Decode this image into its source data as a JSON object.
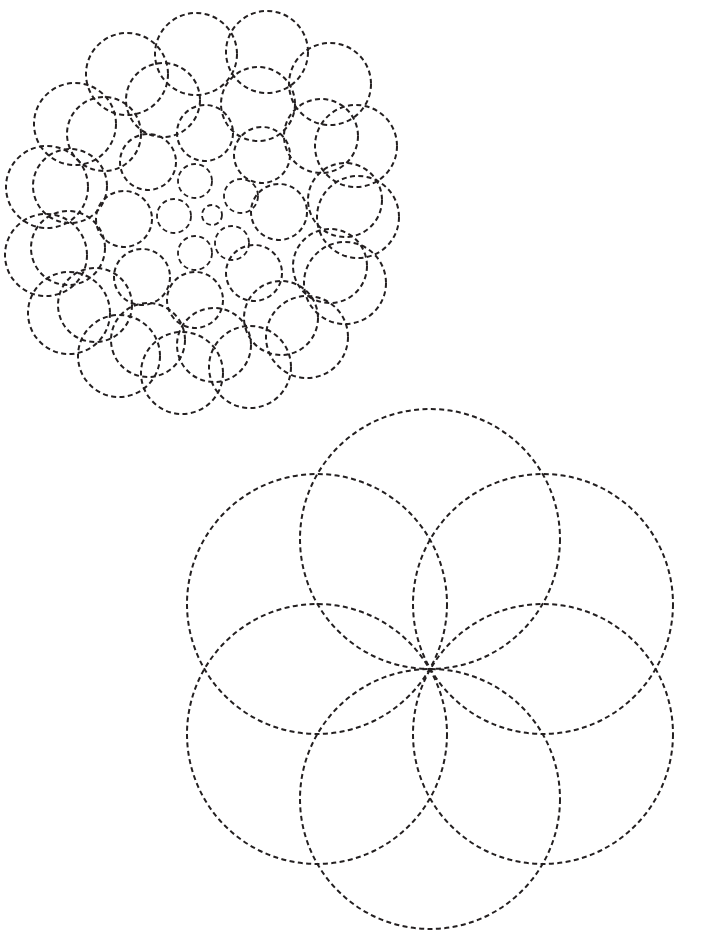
{
  "page": {
    "background_color": "#ffffff",
    "width": 711,
    "height": 943
  },
  "style": {
    "stroke_color": "#231f20",
    "stroke_width": 2.0,
    "stroke_width_thin": 1.8,
    "dash_length": 5,
    "dash_gap": 3.4,
    "dash_array": "5,3.4",
    "fill": "none"
  },
  "figures": [
    {
      "id": "doyle-spiral-figure",
      "name": "Tangent circle spiral rosette",
      "type": "doyle-spiral",
      "bounds": {
        "x": 16,
        "y": 12,
        "width": 374,
        "height": 383
      },
      "center": {
        "x": 212,
        "y": 215
      },
      "description": "Logarithmic spiral packing of mutually tangent dashed circles growing outward from a small central circle",
      "spiral": {
        "arms": 8,
        "rings": 5,
        "growth_ratio": 1.62,
        "twist_degrees": 25,
        "base_radius": 10,
        "base_distance": 0
      },
      "circles": [
        {
          "cx": 212,
          "cy": 215,
          "r": 10
        },
        {
          "cx": 241,
          "cy": 196,
          "r": 17
        },
        {
          "cx": 232,
          "cy": 243,
          "r": 17
        },
        {
          "cx": 195,
          "cy": 253,
          "r": 17
        },
        {
          "cx": 174,
          "cy": 216,
          "r": 17
        },
        {
          "cx": 195,
          "cy": 181,
          "r": 17
        },
        {
          "cx": 262,
          "cy": 155,
          "r": 28
        },
        {
          "cx": 279,
          "cy": 212,
          "r": 28
        },
        {
          "cx": 254,
          "cy": 273,
          "r": 28
        },
        {
          "cx": 195,
          "cy": 300,
          "r": 28
        },
        {
          "cx": 142,
          "cy": 277,
          "r": 28
        },
        {
          "cx": 124,
          "cy": 219,
          "r": 28
        },
        {
          "cx": 148,
          "cy": 162,
          "r": 28
        },
        {
          "cx": 205,
          "cy": 133,
          "r": 28
        },
        {
          "cx": 258,
          "cy": 104,
          "r": 37
        },
        {
          "cx": 321,
          "cy": 136,
          "r": 37
        },
        {
          "cx": 345,
          "cy": 200,
          "r": 37
        },
        {
          "cx": 330,
          "cy": 266,
          "r": 37
        },
        {
          "cx": 281,
          "cy": 318,
          "r": 37
        },
        {
          "cx": 214,
          "cy": 345,
          "r": 37
        },
        {
          "cx": 148,
          "cy": 340,
          "r": 37
        },
        {
          "cx": 95,
          "cy": 305,
          "r": 37
        },
        {
          "cx": 68,
          "cy": 248,
          "r": 37
        },
        {
          "cx": 70,
          "cy": 186,
          "r": 37
        },
        {
          "cx": 104,
          "cy": 134,
          "r": 37
        },
        {
          "cx": 163,
          "cy": 100,
          "r": 37
        },
        {
          "cx": 196,
          "cy": 54,
          "r": 41
        },
        {
          "cx": 267,
          "cy": 52,
          "r": 41
        },
        {
          "cx": 330,
          "cy": 84,
          "r": 41
        },
        {
          "cx": 356,
          "cy": 146,
          "r": 41
        },
        {
          "cx": 358,
          "cy": 217,
          "r": 41
        },
        {
          "cx": 345,
          "cy": 283,
          "r": 41
        },
        {
          "cx": 307,
          "cy": 337,
          "r": 41
        },
        {
          "cx": 250,
          "cy": 367,
          "r": 41
        },
        {
          "cx": 182,
          "cy": 373,
          "r": 41
        },
        {
          "cx": 119,
          "cy": 356,
          "r": 41
        },
        {
          "cx": 69,
          "cy": 313,
          "r": 41
        },
        {
          "cx": 46,
          "cy": 255,
          "r": 41
        },
        {
          "cx": 47,
          "cy": 187,
          "r": 41
        },
        {
          "cx": 75,
          "cy": 124,
          "r": 41
        },
        {
          "cx": 127,
          "cy": 74,
          "r": 41
        }
      ]
    },
    {
      "id": "six-petal-rosette-figure",
      "name": "Six-circle petal rosette",
      "type": "rosette",
      "bounds": {
        "x": 165,
        "y": 409,
        "width": 530,
        "height": 519
      },
      "center": {
        "x": 430,
        "y": 669
      },
      "description": "Six equal dashed circles arranged with centers on a circle of equal radius, all passing through the common center point forming a six-petal flower",
      "rosette": {
        "petal_count": 6,
        "circle_radius": 130,
        "center_ring_radius": 130,
        "start_angle_degrees": -90
      },
      "circles": [
        {
          "cx": 430,
          "cy": 539,
          "r": 130,
          "label": "petal-circle-top"
        },
        {
          "cx": 543,
          "cy": 604,
          "r": 130,
          "label": "petal-circle-upper-right"
        },
        {
          "cx": 543,
          "cy": 734,
          "r": 130,
          "label": "petal-circle-lower-right"
        },
        {
          "cx": 430,
          "cy": 799,
          "r": 130,
          "label": "petal-circle-bottom"
        },
        {
          "cx": 317,
          "cy": 734,
          "r": 130,
          "label": "petal-circle-lower-left"
        },
        {
          "cx": 317,
          "cy": 604,
          "r": 130,
          "label": "petal-circle-upper-left"
        }
      ],
      "convergence_point": {
        "x": 430,
        "y": 669
      }
    }
  ]
}
